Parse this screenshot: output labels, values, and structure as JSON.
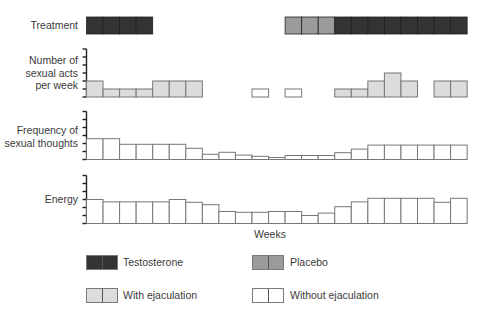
{
  "chart_data": {
    "type": "bar",
    "title": "",
    "xlabel": "Weeks",
    "weeks": [
      1,
      2,
      3,
      4,
      5,
      6,
      7,
      8,
      9,
      10,
      11,
      12,
      13,
      14,
      15,
      16,
      17,
      18,
      19,
      20,
      21,
      22,
      23
    ],
    "treatment": {
      "label": "Treatment",
      "values": [
        "testosterone",
        "testosterone",
        "testosterone",
        "testosterone",
        null,
        null,
        null,
        null,
        null,
        null,
        null,
        null,
        "placebo",
        "placebo",
        "placebo",
        "testosterone",
        "testosterone",
        "testosterone",
        "testosterone",
        "testosterone",
        "testosterone",
        "testosterone",
        "testosterone"
      ]
    },
    "panels": [
      {
        "name": "sexual-acts",
        "label_lines": [
          "Number of",
          "sexual acts",
          "per week"
        ],
        "ylim": [
          0,
          6
        ],
        "ticks": 6,
        "values": [
          2,
          1,
          1,
          1,
          2,
          2,
          2,
          null,
          null,
          null,
          1,
          null,
          1,
          null,
          null,
          1,
          1,
          2,
          3,
          2,
          null,
          2,
          2
        ],
        "fill": [
          "with",
          "with",
          "with",
          "with",
          "with",
          "with",
          "with",
          null,
          null,
          null,
          "without",
          null,
          "without",
          null,
          null,
          "with",
          "with",
          "with",
          "with",
          "with",
          null,
          "with",
          "with"
        ]
      },
      {
        "name": "sexual-thoughts",
        "label_lines": [
          "Frequency of",
          "sexual thoughts"
        ],
        "ylim": [
          0,
          6
        ],
        "ticks": 6,
        "values": [
          2.6,
          2.6,
          1.9,
          1.9,
          1.9,
          1.9,
          1.4,
          0.65,
          0.9,
          0.55,
          0.4,
          0.25,
          0.5,
          0.5,
          0.5,
          0.85,
          1.3,
          1.8,
          1.8,
          1.8,
          1.8,
          1.8,
          1.8
        ],
        "fill": "without"
      },
      {
        "name": "energy",
        "label_lines": [
          "Energy"
        ],
        "ylim": [
          0,
          6
        ],
        "ticks": 6,
        "values": [
          3.0,
          2.7,
          2.7,
          2.7,
          2.7,
          3.0,
          2.65,
          2.35,
          1.5,
          1.4,
          1.4,
          1.5,
          1.5,
          1.0,
          1.3,
          2.1,
          2.7,
          3.15,
          3.15,
          3.15,
          3.15,
          2.65,
          3.15
        ],
        "fill": "without"
      }
    ],
    "legend": [
      {
        "key": "testosterone",
        "label": "Testosterone"
      },
      {
        "key": "placebo",
        "label": "Placebo"
      },
      {
        "key": "with",
        "label": "With ejaculation"
      },
      {
        "key": "without",
        "label": "Without ejaculation"
      }
    ],
    "colors": {
      "testosterone": "#333333",
      "placebo": "#9b9b9b",
      "with": "#dcdcdc",
      "without": "#ffffff",
      "outline": "#777777"
    }
  },
  "labels": {
    "treatment": "Treatment",
    "acts_1": "Number of",
    "acts_2": "sexual acts",
    "acts_3": "per week",
    "thoughts_1": "Frequency of",
    "thoughts_2": "sexual thoughts",
    "energy": "Energy",
    "weeks": "Weeks"
  },
  "legend": {
    "testosterone": "Testosterone",
    "placebo": "Placebo",
    "with_ejaculation": "With ejaculation",
    "without_ejaculation": "Without ejaculation"
  }
}
